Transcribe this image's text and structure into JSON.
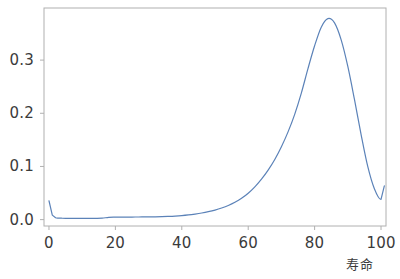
{
  "figure": {
    "background_color": "#ffffff",
    "frame_color": "#b0b0b0",
    "tick_color": "#b0b0b0",
    "text_color": "#3b3b3b",
    "line_color": "#5b82b8"
  },
  "axes": {
    "plot_left_px": 44,
    "plot_right_px": 386,
    "plot_top_px": 8,
    "plot_bottom_px": 226
  },
  "chart_data": {
    "type": "line",
    "title": "",
    "xlabel": "寿命",
    "ylabel": "",
    "xlim": [
      -1.5,
      101.5
    ],
    "ylim": [
      -0.012,
      0.398
    ],
    "grid": false,
    "legend": null,
    "legend_position": "none",
    "line_color": "#5b82b8",
    "line_width": 1.2,
    "xticks": [
      0,
      20,
      40,
      60,
      80,
      100
    ],
    "xtick_labels": [
      "0",
      "20",
      "40",
      "60",
      "80",
      "100"
    ],
    "yticks": [
      0.0,
      0.1,
      0.2,
      0.3
    ],
    "ytick_labels": [
      "0.0",
      "0.1",
      "0.2",
      "0.3"
    ],
    "annotations": [
      "infant-mortality-spike-at-age-0",
      "peak-density-near-age-84",
      "upturn-at-right-edge-age-101"
    ],
    "series": [
      {
        "name": "寿命分布",
        "x": [
          0,
          1,
          2,
          3,
          4,
          5,
          6,
          8,
          10,
          12,
          14,
          16,
          18,
          20,
          22,
          24,
          26,
          28,
          30,
          32,
          34,
          36,
          38,
          40,
          42,
          44,
          46,
          48,
          50,
          52,
          54,
          56,
          58,
          60,
          62,
          64,
          66,
          68,
          70,
          72,
          74,
          76,
          78,
          80,
          82,
          84,
          86,
          88,
          90,
          92,
          94,
          96,
          98,
          100,
          101
        ],
        "y": [
          0.0355,
          0.0085,
          0.0034,
          0.0028,
          0.0026,
          0.0025,
          0.0024,
          0.0023,
          0.0023,
          0.0023,
          0.0024,
          0.0027,
          0.0043,
          0.0046,
          0.0047,
          0.0048,
          0.0049,
          0.005,
          0.0051,
          0.0053,
          0.0056,
          0.006,
          0.0066,
          0.0075,
          0.0088,
          0.0105,
          0.0125,
          0.015,
          0.018,
          0.0218,
          0.0265,
          0.0325,
          0.04,
          0.0495,
          0.0615,
          0.076,
          0.093,
          0.113,
          0.137,
          0.165,
          0.198,
          0.238,
          0.284,
          0.327,
          0.362,
          0.378,
          0.37,
          0.338,
          0.288,
          0.226,
          0.16,
          0.1,
          0.058,
          0.038,
          0.0635
        ]
      }
    ]
  },
  "xtick_positions_px": [
    54,
    120,
    186,
    252,
    318,
    384
  ],
  "ytick_positions_px": [
    214,
    162,
    110,
    58
  ]
}
